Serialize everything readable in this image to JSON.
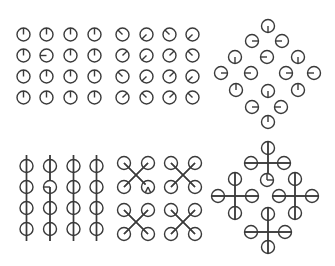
{
  "figure": {
    "width": 335,
    "height": 266,
    "stroke_color": "#3a3a3a",
    "background": "#ffffff",
    "radius": 6.5
  },
  "panels": [
    {
      "name": "grid-up-hands",
      "connectors": [],
      "clocks": [
        {
          "x": 23.5,
          "y": 34.5,
          "hands": [
            0
          ]
        },
        {
          "x": 46.5,
          "y": 34.5,
          "hands": [
            0
          ]
        },
        {
          "x": 70.5,
          "y": 34.5,
          "hands": [
            0
          ]
        },
        {
          "x": 94.5,
          "y": 34.5,
          "hands": [
            0
          ]
        },
        {
          "x": 23.5,
          "y": 55.5,
          "hands": [
            0
          ]
        },
        {
          "x": 46.5,
          "y": 55.5,
          "hands": [
            270
          ]
        },
        {
          "x": 70.5,
          "y": 55.5,
          "hands": [
            0
          ]
        },
        {
          "x": 94.5,
          "y": 55.5,
          "hands": [
            0
          ]
        },
        {
          "x": 23.5,
          "y": 76.5,
          "hands": [
            0
          ]
        },
        {
          "x": 46.5,
          "y": 76.5,
          "hands": [
            0
          ]
        },
        {
          "x": 70.5,
          "y": 76.5,
          "hands": [
            0
          ]
        },
        {
          "x": 94.5,
          "y": 76.5,
          "hands": [
            0
          ]
        },
        {
          "x": 23.5,
          "y": 97.5,
          "hands": [
            0
          ]
        },
        {
          "x": 46.5,
          "y": 97.5,
          "hands": [
            0
          ]
        },
        {
          "x": 70.5,
          "y": 97.5,
          "hands": [
            0
          ]
        },
        {
          "x": 94.5,
          "y": 97.5,
          "hands": [
            0
          ]
        }
      ]
    },
    {
      "name": "grid-diagonal-hands",
      "connectors": [],
      "clocks": [
        {
          "x": 122.5,
          "y": 34.5,
          "hands": [
            315
          ]
        },
        {
          "x": 146.5,
          "y": 34.5,
          "hands": [
            225
          ]
        },
        {
          "x": 169.5,
          "y": 34.5,
          "hands": [
            315
          ]
        },
        {
          "x": 192.5,
          "y": 34.5,
          "hands": [
            225
          ]
        },
        {
          "x": 122.5,
          "y": 55.5,
          "hands": [
            45
          ]
        },
        {
          "x": 146.5,
          "y": 55.5,
          "hands": [
            225
          ]
        },
        {
          "x": 169.5,
          "y": 55.5,
          "hands": [
            45
          ]
        },
        {
          "x": 192.5,
          "y": 55.5,
          "hands": [
            315
          ]
        },
        {
          "x": 122.5,
          "y": 76.5,
          "hands": [
            315
          ]
        },
        {
          "x": 146.5,
          "y": 76.5,
          "hands": [
            225
          ]
        },
        {
          "x": 169.5,
          "y": 76.5,
          "hands": [
            45
          ]
        },
        {
          "x": 192.5,
          "y": 76.5,
          "hands": [
            225
          ]
        },
        {
          "x": 122.5,
          "y": 97.5,
          "hands": [
            45
          ]
        },
        {
          "x": 146.5,
          "y": 97.5,
          "hands": [
            315
          ]
        },
        {
          "x": 169.5,
          "y": 97.5,
          "hands": [
            45
          ]
        },
        {
          "x": 192.5,
          "y": 97.5,
          "hands": [
            315
          ]
        }
      ]
    },
    {
      "name": "diamond-cardinal-hands",
      "connectors": [],
      "clocks": [
        {
          "x": 268,
          "y": 26,
          "hands": [
            180
          ]
        },
        {
          "x": 252,
          "y": 41,
          "hands": [
            90
          ]
        },
        {
          "x": 282,
          "y": 41,
          "hands": [
            270
          ]
        },
        {
          "x": 235,
          "y": 57,
          "hands": [
            180
          ]
        },
        {
          "x": 267,
          "y": 57,
          "hands": [
            270
          ]
        },
        {
          "x": 298,
          "y": 57,
          "hands": [
            180
          ]
        },
        {
          "x": 221,
          "y": 73,
          "hands": [
            90
          ]
        },
        {
          "x": 251,
          "y": 73,
          "hands": [
            270
          ]
        },
        {
          "x": 286,
          "y": 73,
          "hands": [
            90
          ]
        },
        {
          "x": 314,
          "y": 73,
          "hands": [
            270
          ]
        },
        {
          "x": 236,
          "y": 90,
          "hands": [
            0
          ]
        },
        {
          "x": 268,
          "y": 91,
          "hands": [
            180
          ]
        },
        {
          "x": 298,
          "y": 90,
          "hands": [
            0
          ]
        },
        {
          "x": 252,
          "y": 107,
          "hands": [
            90
          ]
        },
        {
          "x": 281,
          "y": 107,
          "hands": [
            270
          ]
        },
        {
          "x": 268,
          "y": 122,
          "hands": [
            0
          ]
        }
      ]
    },
    {
      "name": "grid-vertical-chains",
      "connectors": [
        {
          "x1": 26.5,
          "y1": 155,
          "x2": 26.5,
          "y2": 241
        },
        {
          "x1": 50,
          "y1": 155,
          "x2": 50,
          "y2": 180.5
        },
        {
          "x1": 50,
          "y1": 187,
          "x2": 50,
          "y2": 241
        },
        {
          "x1": 73.5,
          "y1": 155,
          "x2": 73.5,
          "y2": 241
        },
        {
          "x1": 96.5,
          "y1": 155,
          "x2": 96.5,
          "y2": 241
        }
      ],
      "clocks": [
        {
          "x": 26.5,
          "y": 166,
          "hands": []
        },
        {
          "x": 50,
          "y": 166,
          "hands": []
        },
        {
          "x": 73.5,
          "y": 166,
          "hands": []
        },
        {
          "x": 96.5,
          "y": 166,
          "hands": []
        },
        {
          "x": 26.5,
          "y": 187,
          "hands": []
        },
        {
          "x": 50,
          "y": 187,
          "hands": [
            270
          ]
        },
        {
          "x": 73.5,
          "y": 187,
          "hands": []
        },
        {
          "x": 96.5,
          "y": 187,
          "hands": []
        },
        {
          "x": 26.5,
          "y": 208,
          "hands": []
        },
        {
          "x": 50,
          "y": 208,
          "hands": []
        },
        {
          "x": 73.5,
          "y": 208,
          "hands": []
        },
        {
          "x": 96.5,
          "y": 208,
          "hands": []
        },
        {
          "x": 26.5,
          "y": 229,
          "hands": []
        },
        {
          "x": 50,
          "y": 229,
          "hands": []
        },
        {
          "x": 73.5,
          "y": 229,
          "hands": []
        },
        {
          "x": 96.5,
          "y": 229,
          "hands": []
        }
      ]
    },
    {
      "name": "grid-x-clusters",
      "connectors": [
        {
          "x1": 124,
          "y1": 163,
          "x2": 145.5,
          "y2": 184.5
        },
        {
          "x1": 148,
          "y1": 163,
          "x2": 124,
          "y2": 187
        },
        {
          "x1": 171,
          "y1": 163,
          "x2": 195,
          "y2": 187
        },
        {
          "x1": 195,
          "y1": 163,
          "x2": 171,
          "y2": 187
        },
        {
          "x1": 124,
          "y1": 210,
          "x2": 148,
          "y2": 234
        },
        {
          "x1": 148,
          "y1": 210,
          "x2": 124,
          "y2": 234
        },
        {
          "x1": 171,
          "y1": 210,
          "x2": 195,
          "y2": 234
        },
        {
          "x1": 195,
          "y1": 210,
          "x2": 171,
          "y2": 234
        }
      ],
      "clocks": [
        {
          "x": 124,
          "y": 163,
          "hands": []
        },
        {
          "x": 148,
          "y": 163,
          "hands": []
        },
        {
          "x": 171,
          "y": 163,
          "hands": []
        },
        {
          "x": 195,
          "y": 163,
          "hands": []
        },
        {
          "x": 124,
          "y": 187,
          "hands": []
        },
        {
          "x": 148,
          "y": 187,
          "hands": [
            205,
            155
          ]
        },
        {
          "x": 171,
          "y": 187,
          "hands": []
        },
        {
          "x": 195,
          "y": 187,
          "hands": []
        },
        {
          "x": 124,
          "y": 210,
          "hands": []
        },
        {
          "x": 148,
          "y": 210,
          "hands": []
        },
        {
          "x": 171,
          "y": 210,
          "hands": []
        },
        {
          "x": 195,
          "y": 210,
          "hands": []
        },
        {
          "x": 124,
          "y": 234,
          "hands": []
        },
        {
          "x": 148,
          "y": 234,
          "hands": []
        },
        {
          "x": 171,
          "y": 234,
          "hands": []
        },
        {
          "x": 195,
          "y": 234,
          "hands": []
        }
      ]
    },
    {
      "name": "diamond-plus-clusters",
      "connectors": [
        {
          "x1": 268,
          "y1": 141,
          "x2": 268,
          "y2": 174
        },
        {
          "x1": 244,
          "y1": 163,
          "x2": 291,
          "y2": 163
        },
        {
          "x1": 235,
          "y1": 172,
          "x2": 235,
          "y2": 220
        },
        {
          "x1": 211,
          "y1": 196,
          "x2": 259,
          "y2": 196
        },
        {
          "x1": 295,
          "y1": 172,
          "x2": 295,
          "y2": 220
        },
        {
          "x1": 272,
          "y1": 196,
          "x2": 319,
          "y2": 196
        },
        {
          "x1": 268,
          "y1": 207,
          "x2": 268,
          "y2": 254
        },
        {
          "x1": 244,
          "y1": 232,
          "x2": 292,
          "y2": 232
        }
      ],
      "clocks": [
        {
          "x": 268,
          "y": 148,
          "hands": []
        },
        {
          "x": 251,
          "y": 163,
          "hands": []
        },
        {
          "x": 284,
          "y": 163,
          "hands": []
        },
        {
          "x": 267,
          "y": 180,
          "hands": [
            0,
            90
          ]
        },
        {
          "x": 235,
          "y": 179,
          "hands": []
        },
        {
          "x": 218,
          "y": 196,
          "hands": []
        },
        {
          "x": 252,
          "y": 196,
          "hands": []
        },
        {
          "x": 235,
          "y": 213,
          "hands": []
        },
        {
          "x": 295,
          "y": 179,
          "hands": []
        },
        {
          "x": 279,
          "y": 196,
          "hands": []
        },
        {
          "x": 312,
          "y": 196,
          "hands": []
        },
        {
          "x": 295,
          "y": 213,
          "hands": []
        },
        {
          "x": 268,
          "y": 214,
          "hands": []
        },
        {
          "x": 251,
          "y": 232,
          "hands": []
        },
        {
          "x": 285,
          "y": 232,
          "hands": []
        },
        {
          "x": 268,
          "y": 247,
          "hands": []
        }
      ]
    }
  ]
}
